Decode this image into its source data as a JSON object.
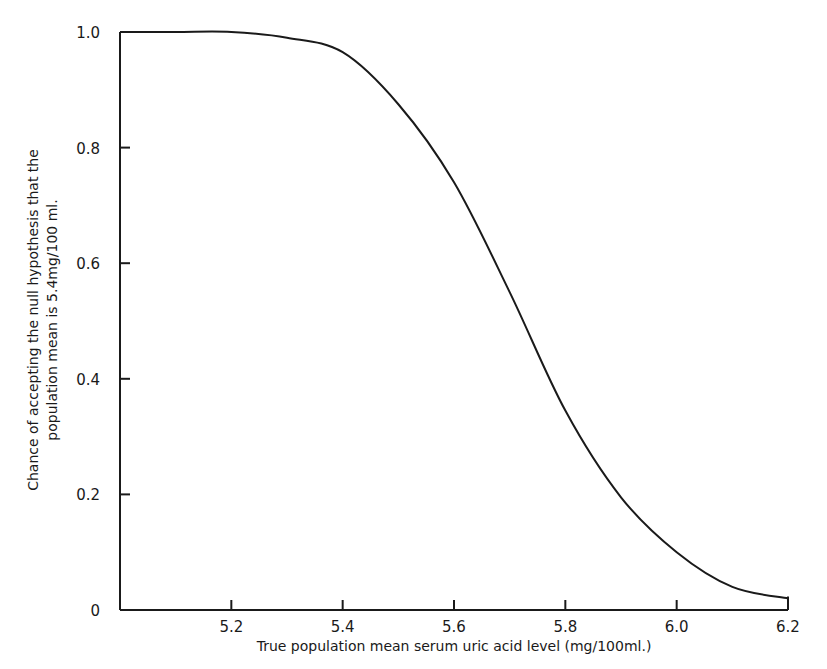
{
  "chart_data": {
    "type": "line",
    "title": "",
    "xlabel": "True population mean serum uric acid level (mg/100ml.)",
    "ylabel_lines": [
      "Chance of accepting the null hypothesis that the",
      "population mean is 5.4mg/100 ml."
    ],
    "ylabel": "Chance of accepting the null hypothesis that the population mean is 5.4mg/100 ml.",
    "xlim": [
      5.0,
      6.2
    ],
    "ylim": [
      0,
      1.0
    ],
    "x_ticks": [
      5.2,
      5.4,
      5.6,
      5.8,
      6.0,
      6.2
    ],
    "x_tick_labels": [
      "5.2",
      "5.4",
      "5.6",
      "5.8",
      "6.0",
      "6.2"
    ],
    "y_ticks": [
      0,
      0.2,
      0.4,
      0.6,
      0.8,
      1.0
    ],
    "y_tick_labels": [
      "0",
      "0.2",
      "0.4",
      "0.6",
      "0.8",
      "1.0"
    ],
    "grid": false,
    "legend": null,
    "series": [
      {
        "name": "Operating characteristic curve",
        "x": [
          5.0,
          5.1,
          5.2,
          5.3,
          5.4,
          5.5,
          5.6,
          5.7,
          5.8,
          5.9,
          6.0,
          6.1,
          6.2
        ],
        "y": [
          1.0,
          1.0,
          1.0,
          0.99,
          0.965,
          0.875,
          0.74,
          0.55,
          0.345,
          0.195,
          0.1,
          0.04,
          0.02
        ]
      }
    ],
    "line_color": "#1a1a1a"
  }
}
